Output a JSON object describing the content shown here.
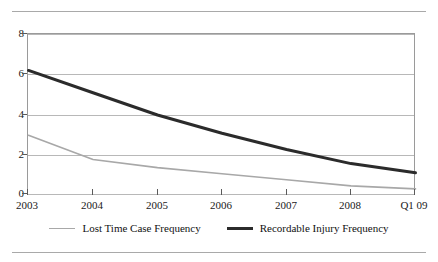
{
  "title": "FIGURE 10.7   SAFETY TREND DATA",
  "chart_data": {
    "type": "line",
    "title": "FIGURE 10.7   SAFETY TREND DATA",
    "xlabel": "",
    "ylabel": "",
    "categories": [
      "2003",
      "2004",
      "2005",
      "2006",
      "2007",
      "2008",
      "Q1 09"
    ],
    "x_tick_labels": [
      "2003",
      "2004",
      "2005",
      "2006",
      "2007",
      "2008",
      "Q1 09"
    ],
    "y_tick_labels": [
      "0",
      "2",
      "4",
      "6",
      "8"
    ],
    "y_ticks": [
      0,
      2,
      4,
      6,
      8
    ],
    "ylim": [
      0,
      8
    ],
    "grid": true,
    "grid_axis": "y",
    "legend_position": "bottom",
    "series": [
      {
        "name": "Lost Time Case Frequency",
        "color": "#a8a8a8",
        "width": 1.6,
        "values": [
          3.0,
          1.8,
          1.4,
          1.1,
          0.8,
          0.5,
          0.35
        ]
      },
      {
        "name": "Recordable Injury Frequency",
        "color": "#2b2b2b",
        "width": 3.0,
        "values": [
          6.2,
          5.1,
          4.0,
          3.1,
          2.3,
          1.6,
          1.15
        ]
      }
    ]
  },
  "legend": {
    "items": [
      {
        "label": "Lost Time Case Frequency",
        "color": "#a8a8a8",
        "weight": "thin"
      },
      {
        "label": "Recordable Injury Frequency",
        "color": "#2b2b2b",
        "weight": "thick"
      }
    ]
  },
  "axis": {
    "y_labels": [
      "8",
      "6",
      "4",
      "2",
      "0"
    ],
    "x_labels": [
      "2003",
      "2004",
      "2005",
      "2006",
      "2007",
      "2008",
      "Q1 09"
    ]
  }
}
